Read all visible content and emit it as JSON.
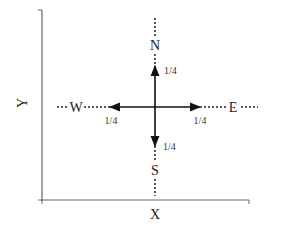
{
  "diagram": {
    "axes": {
      "x_label": "X",
      "y_label": "Y",
      "color": "#555555"
    },
    "compass": {
      "center": [
        155,
        107
      ],
      "arrow_color": "#111111",
      "dotted_color": "#222222",
      "directions": [
        {
          "id": "north",
          "label": "N",
          "probability": "1/4"
        },
        {
          "id": "south",
          "label": "S",
          "probability": "1/4"
        },
        {
          "id": "west",
          "label": "W",
          "probability": "1/4"
        },
        {
          "id": "east",
          "label": "E",
          "probability": "1/4"
        }
      ]
    }
  }
}
